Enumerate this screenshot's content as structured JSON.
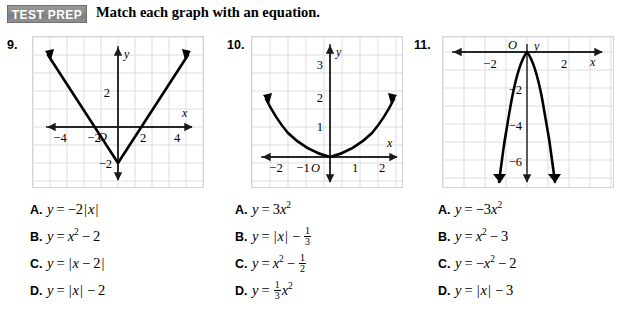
{
  "header": {
    "badge": "TEST PREP",
    "title": "Match each graph with an equation."
  },
  "problems": [
    {
      "number": "9.",
      "graph": {
        "type": "absolute-value",
        "equation": "y = |x| - 2",
        "vertex": [
          0,
          -2
        ],
        "xlabel": "x",
        "ylabel": "y",
        "origin_label": "O",
        "x_ticks": [
          "-4",
          "-2",
          "2",
          "4"
        ],
        "y_ticks": [
          "2",
          "-2"
        ],
        "xlim": [
          -5,
          5
        ],
        "ylim": [
          -4,
          3
        ],
        "grid": true
      },
      "options": [
        {
          "letter": "A.",
          "parts": [
            {
              "t": "var",
              "v": "y"
            },
            {
              "t": "op",
              "v": "="
            },
            {
              "t": "num",
              "v": "−2"
            },
            {
              "t": "bar",
              "v": "|"
            },
            {
              "t": "var",
              "v": "x"
            },
            {
              "t": "bar",
              "v": "|"
            }
          ]
        },
        {
          "letter": "B.",
          "parts": [
            {
              "t": "var",
              "v": "y"
            },
            {
              "t": "op",
              "v": "="
            },
            {
              "t": "var",
              "v": "x"
            },
            {
              "t": "sup",
              "v": "2"
            },
            {
              "t": "op",
              "v": "−"
            },
            {
              "t": "num",
              "v": "2"
            }
          ]
        },
        {
          "letter": "C.",
          "parts": [
            {
              "t": "var",
              "v": "y"
            },
            {
              "t": "op",
              "v": "="
            },
            {
              "t": "bar",
              "v": "|"
            },
            {
              "t": "var",
              "v": "x"
            },
            {
              "t": "op",
              "v": "−"
            },
            {
              "t": "num",
              "v": "2"
            },
            {
              "t": "bar",
              "v": "|"
            }
          ]
        },
        {
          "letter": "D.",
          "parts": [
            {
              "t": "var",
              "v": "y"
            },
            {
              "t": "op",
              "v": "="
            },
            {
              "t": "bar",
              "v": "|"
            },
            {
              "t": "var",
              "v": "x"
            },
            {
              "t": "bar",
              "v": "|"
            },
            {
              "t": "op",
              "v": "−"
            },
            {
              "t": "num",
              "v": "2"
            }
          ]
        }
      ]
    },
    {
      "number": "10.",
      "graph": {
        "type": "parabola",
        "equation": "y = (1/3)x^2",
        "coefficient": 0.3333,
        "vertex": [
          0,
          0
        ],
        "xlabel": "x",
        "ylabel": "y",
        "origin_label": "O",
        "x_ticks": [
          "-2",
          "-1",
          "1",
          "2"
        ],
        "y_ticks": [
          "1",
          "2",
          "3"
        ],
        "xlim": [
          -2.7,
          2.7
        ],
        "ylim": [
          -1,
          3.6
        ],
        "grid": true
      },
      "options": [
        {
          "letter": "A.",
          "parts": [
            {
              "t": "var",
              "v": "y"
            },
            {
              "t": "op",
              "v": "="
            },
            {
              "t": "num",
              "v": "3"
            },
            {
              "t": "var",
              "v": "x"
            },
            {
              "t": "sup",
              "v": "2"
            }
          ]
        },
        {
          "letter": "B.",
          "parts": [
            {
              "t": "var",
              "v": "y"
            },
            {
              "t": "op",
              "v": "="
            },
            {
              "t": "bar",
              "v": "|"
            },
            {
              "t": "var",
              "v": "x"
            },
            {
              "t": "bar",
              "v": "|"
            },
            {
              "t": "op",
              "v": "−"
            },
            {
              "t": "frac",
              "n": "1",
              "d": "3"
            }
          ]
        },
        {
          "letter": "C.",
          "parts": [
            {
              "t": "var",
              "v": "y"
            },
            {
              "t": "op",
              "v": "="
            },
            {
              "t": "var",
              "v": "x"
            },
            {
              "t": "sup",
              "v": "2"
            },
            {
              "t": "op",
              "v": "−"
            },
            {
              "t": "frac",
              "n": "1",
              "d": "2"
            }
          ]
        },
        {
          "letter": "D.",
          "parts": [
            {
              "t": "var",
              "v": "y"
            },
            {
              "t": "op",
              "v": "="
            },
            {
              "t": "frac",
              "n": "1",
              "d": "3"
            },
            {
              "t": "var",
              "v": "x"
            },
            {
              "t": "sup",
              "v": "2"
            }
          ]
        }
      ]
    },
    {
      "number": "11.",
      "graph": {
        "type": "parabola",
        "equation": "y = -3x^2",
        "coefficient": -3,
        "vertex": [
          0,
          0
        ],
        "xlabel": "x",
        "ylabel": "y",
        "origin_label": "O",
        "x_ticks": [
          "-2",
          "2"
        ],
        "y_ticks": [
          "-2",
          "-4",
          "-6"
        ],
        "xlim": [
          -3.2,
          3.2
        ],
        "ylim": [
          -8.2,
          0.9
        ],
        "grid": true
      },
      "options": [
        {
          "letter": "A.",
          "parts": [
            {
              "t": "var",
              "v": "y"
            },
            {
              "t": "op",
              "v": "="
            },
            {
              "t": "num",
              "v": "−3"
            },
            {
              "t": "var",
              "v": "x"
            },
            {
              "t": "sup",
              "v": "2"
            }
          ]
        },
        {
          "letter": "B.",
          "parts": [
            {
              "t": "var",
              "v": "y"
            },
            {
              "t": "op",
              "v": "="
            },
            {
              "t": "var",
              "v": "x"
            },
            {
              "t": "sup",
              "v": "2"
            },
            {
              "t": "op",
              "v": "−"
            },
            {
              "t": "num",
              "v": "3"
            }
          ]
        },
        {
          "letter": "C.",
          "parts": [
            {
              "t": "var",
              "v": "y"
            },
            {
              "t": "op",
              "v": "="
            },
            {
              "t": "num",
              "v": "−"
            },
            {
              "t": "var",
              "v": "x"
            },
            {
              "t": "sup",
              "v": "2"
            },
            {
              "t": "op",
              "v": "−"
            },
            {
              "t": "num",
              "v": "2"
            }
          ]
        },
        {
          "letter": "D.",
          "parts": [
            {
              "t": "var",
              "v": "y"
            },
            {
              "t": "op",
              "v": "="
            },
            {
              "t": "bar",
              "v": "|"
            },
            {
              "t": "var",
              "v": "x"
            },
            {
              "t": "bar",
              "v": "|"
            },
            {
              "t": "op",
              "v": "−"
            },
            {
              "t": "num",
              "v": "3"
            }
          ]
        }
      ]
    }
  ]
}
